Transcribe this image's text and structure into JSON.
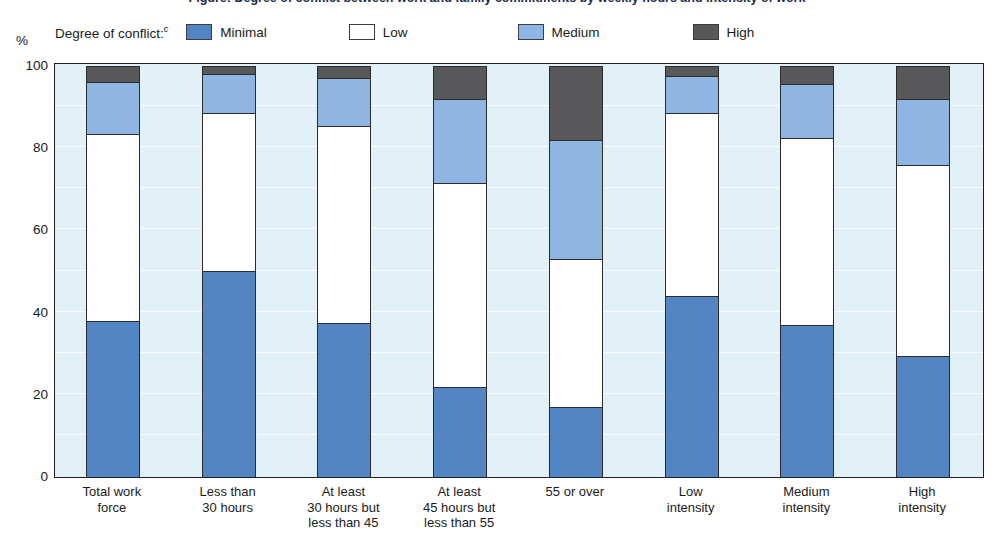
{
  "title": "Figure: Degree of conflict between work and family commitments by weekly hours and intensity of work",
  "axis": {
    "y_unit": "%",
    "y_ticks": [
      "0",
      "20",
      "40",
      "60",
      "80",
      "100"
    ]
  },
  "legend": {
    "title": "Degree of conflict:",
    "title_superscript": "c",
    "items": [
      {
        "label": "Minimal",
        "color": "#5384c4"
      },
      {
        "label": "Low",
        "color": "#ffffff"
      },
      {
        "label": "Medium",
        "color": "#8fb6e3"
      },
      {
        "label": "High",
        "color": "#58585a"
      }
    ]
  },
  "chart_data": {
    "type": "bar",
    "stacked": true,
    "title": "Degree of conflict between work and family commitments by weekly hours and intensity of work",
    "xlabel": "",
    "ylabel": "%",
    "ylim": [
      0,
      100
    ],
    "yticks": [
      0,
      20,
      40,
      60,
      80,
      100
    ],
    "grid": false,
    "legend_position": "top",
    "categories": [
      "Total work force",
      "Less than 30 hours",
      "At least 30 hours but less than 45",
      "At least 45 hours but less than 55",
      "55 or over",
      "Low intensity",
      "Medium intensity",
      "High intensity"
    ],
    "category_lines": [
      [
        "Total work",
        "force"
      ],
      [
        "Less than",
        "30 hours"
      ],
      [
        "At least",
        "30 hours but",
        "less than 45"
      ],
      [
        "At least",
        "45 hours but",
        "less than 55"
      ],
      [
        "55 or over"
      ],
      [
        "Low",
        "intensity"
      ],
      [
        "Medium",
        "intensity"
      ],
      [
        "High",
        "intensity"
      ]
    ],
    "series": [
      {
        "name": "Minimal",
        "color": "#5384c4",
        "values": [
          38,
          50,
          37.5,
          22,
          17,
          44,
          37,
          29.5
        ]
      },
      {
        "name": "Low",
        "color": "#ffffff",
        "values": [
          45.5,
          38.5,
          48,
          49.5,
          36,
          44.5,
          45.5,
          46.5
        ]
      },
      {
        "name": "Medium",
        "color": "#8fb6e3",
        "values": [
          12.5,
          9.5,
          11.5,
          20.5,
          29,
          9,
          13,
          16
        ]
      },
      {
        "name": "High",
        "color": "#58585a",
        "values": [
          4,
          2,
          3,
          8,
          18,
          2.5,
          4.5,
          8
        ]
      }
    ],
    "cumulative_tops": {
      "Total work force": {
        "minimal": 38,
        "low": 83.5,
        "medium": 96,
        "high": 100
      },
      "Less than 30 hours": {
        "minimal": 50,
        "low": 88.5,
        "medium": 98,
        "high": 100
      },
      "At least 30 hours but less than 45": {
        "minimal": 37.5,
        "low": 85.5,
        "medium": 97,
        "high": 100
      },
      "At least 45 hours but less than 55": {
        "minimal": 22,
        "low": 71.5,
        "medium": 92,
        "high": 100
      },
      "55 or over": {
        "minimal": 17,
        "low": 53,
        "medium": 82,
        "high": 100
      },
      "Low intensity": {
        "minimal": 44,
        "low": 88.5,
        "medium": 97.5,
        "high": 100
      },
      "Medium intensity": {
        "minimal": 37,
        "low": 82.5,
        "medium": 95.5,
        "high": 100
      },
      "High intensity": {
        "minimal": 29.5,
        "low": 76,
        "medium": 92,
        "high": 100
      }
    }
  },
  "colors": {
    "plot_background": "#e2f0f7",
    "axis_line": "#1d1d1d",
    "text": "#1a1a1a"
  }
}
